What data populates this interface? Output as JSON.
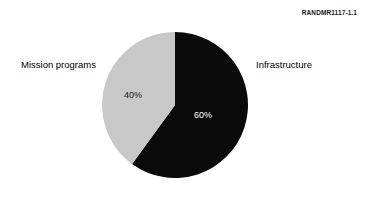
{
  "figure": {
    "id_label": "RANDMR1117-1.1"
  },
  "chart_data": {
    "type": "pie",
    "title": "",
    "xlabel": "",
    "ylabel": "",
    "legend_position": "outside-labels",
    "grid": false,
    "categories": [
      "Infrastructure",
      "Mission programs"
    ],
    "values": [
      60,
      40
    ],
    "value_labels": [
      "60%",
      "40%"
    ],
    "units": "percent",
    "total": 100,
    "start_angle_deg": 0,
    "direction": "clockwise",
    "slices": [
      {
        "name": "Infrastructure",
        "value": 60,
        "value_label": "60%",
        "color": "#0a0a0a",
        "label_color": "#ffffff",
        "start_angle_deg": 0,
        "end_angle_deg": 216
      },
      {
        "name": "Mission programs",
        "value": 40,
        "value_label": "40%",
        "color": "#c8c8c8",
        "label_color": "#1a1a1a",
        "start_angle_deg": 216,
        "end_angle_deg": 360
      }
    ],
    "colors": {
      "infrastructure": "#0a0a0a",
      "mission_programs": "#c8c8c8",
      "background": "#ffffff"
    }
  }
}
